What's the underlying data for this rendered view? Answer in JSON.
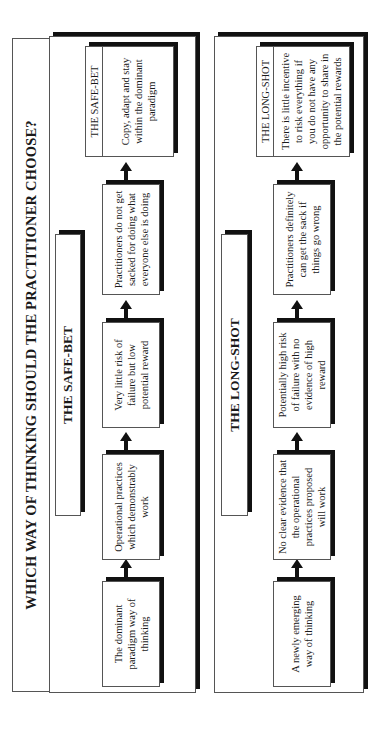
{
  "title": "WHICH WAY OF THINKING SHOULD THE PRACTITIONER CHOOSE?",
  "colors": {
    "line": "#555555",
    "shadow": "#111111",
    "background": "#ffffff"
  },
  "rows": [
    {
      "label": "THE SAFE-BET",
      "steps": [
        "The dominant paradigm way of thinking",
        "Operational practices which demonstrably work",
        "Very little risk of failure but low potential reward",
        "Practitioners do not get sacked for doing what everyone else is doing"
      ],
      "outcome": {
        "header": "THE SAFE-BET",
        "text": "Copy, adapt and stay within the dominant paradigm"
      }
    },
    {
      "label": "THE LONG-SHOT",
      "steps": [
        "A newly emerging way of thinking",
        "No clear evidence that the operational practices proposed will work",
        "Potentially high risk of failure with no evidence of high reward",
        "Practitioners definitely can get the sack if things go wrong"
      ],
      "outcome": {
        "header": "THE LONG-SHOT",
        "text": "There is little incentive to risk everything if you do not have any opportunity to share in the potential rewards"
      }
    }
  ],
  "arrow_icon": "right-arrow-icon"
}
